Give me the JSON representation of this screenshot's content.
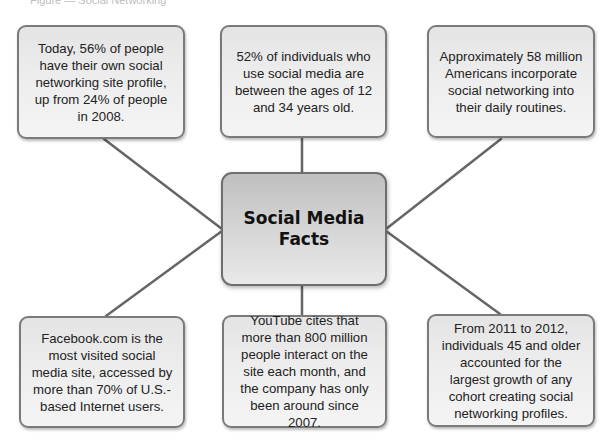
{
  "diagram": {
    "caption": "Figure — Social Networking",
    "center": {
      "title": "Social Media Facts",
      "color_fill": "#d3d3d3",
      "color_border": "#6e6e6e"
    },
    "facts": [
      {
        "position": "top-left",
        "text": "Today, 56% of people have their own social networking site profile, up from 24% of people in 2008."
      },
      {
        "position": "top-center",
        "text": "52% of individuals who use social media are between the ages of 12 and 34 years old."
      },
      {
        "position": "top-right",
        "text": "Approximately 58 million Americans incorporate social networking into their daily routines."
      },
      {
        "position": "bottom-left",
        "text": "Facebook.com is the most visited social media site, accessed by more than 70% of U.S.-based Internet users."
      },
      {
        "position": "bottom-center",
        "text": "YouTube cites that more than 800 million people interact on the site each month, and the company has only been around since 2007."
      },
      {
        "position": "bottom-right",
        "text": "From 2011 to 2012, individuals 45 and older accounted for the largest growth of any cohort creating social networking profiles."
      }
    ],
    "colors": {
      "box_fill": "#ededed",
      "box_border": "#7a7a7a",
      "connector": "#666666",
      "text": "#222222"
    }
  }
}
